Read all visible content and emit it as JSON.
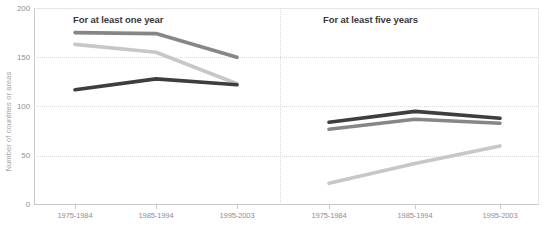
{
  "chart_data": {
    "type": "line",
    "title": "",
    "ylabel": "Number of countries or areas",
    "xlabel": "",
    "ylim": [
      0,
      200
    ],
    "yticks": [
      "0",
      "50",
      "100",
      "150",
      "200"
    ],
    "grid": "horizontal-dotted",
    "legend_position": "none",
    "categories": [
      "1975-1984",
      "1985-1994",
      "1995-2003"
    ],
    "panels": [
      {
        "title": "For at least one year",
        "series": [
          {
            "name": "medium-gray",
            "color": "#868686",
            "values": [
              175,
              174,
              150
            ]
          },
          {
            "name": "light-gray",
            "color": "#c7c7c7",
            "values": [
              163,
              155,
              123
            ]
          },
          {
            "name": "dark",
            "color": "#3e3e3e",
            "values": [
              117,
              128,
              122
            ]
          }
        ]
      },
      {
        "title": "For at least five years",
        "series": [
          {
            "name": "medium-gray",
            "color": "#868686",
            "values": [
              77,
              87,
              83
            ]
          },
          {
            "name": "light-gray",
            "color": "#c7c7c7",
            "values": [
              22,
              42,
              60
            ]
          },
          {
            "name": "dark",
            "color": "#3e3e3e",
            "values": [
              84,
              95,
              88
            ]
          }
        ]
      }
    ]
  }
}
